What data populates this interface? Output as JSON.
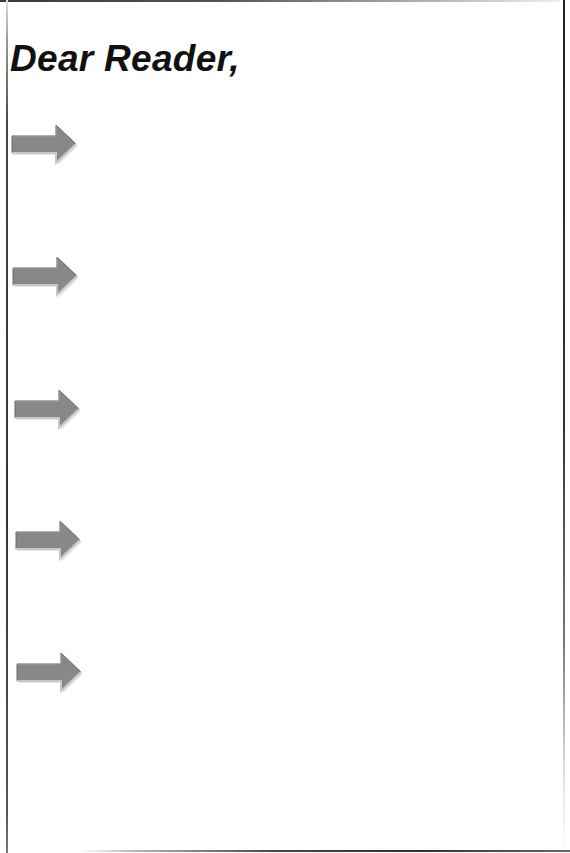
{
  "document": {
    "title": "Dear Reader,",
    "colors": {
      "arrow_fill": "#8a8a8a",
      "arrow_highlight": "#d8d8d8",
      "arrow_shadow": "#555555",
      "text": "#111111",
      "background": "#ffffff"
    },
    "arrows": [
      {
        "icon": "right-arrow-icon",
        "top": 124,
        "left": 10
      },
      {
        "icon": "right-arrow-icon",
        "top": 256,
        "left": 11
      },
      {
        "icon": "right-arrow-icon",
        "top": 389,
        "left": 13
      },
      {
        "icon": "right-arrow-icon",
        "top": 520,
        "left": 14
      },
      {
        "icon": "right-arrow-icon",
        "top": 652,
        "left": 15
      }
    ]
  }
}
